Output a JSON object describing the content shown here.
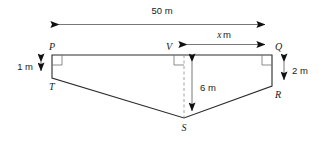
{
  "figure": {
    "background_color": "#ffffff",
    "line_color": "#2b2b2b",
    "dash_color": "#8a8a8a",
    "text_color": "#1a1a1a",
    "vertices": {
      "p": "P",
      "q": "Q",
      "r": "R",
      "s": "S",
      "t": "T",
      "v": "V"
    },
    "dimensions": {
      "top_width": "50 m",
      "right_segment": "x m",
      "right_segment_value": "x",
      "right_segment_unit": "m",
      "left_height": "1 m",
      "right_height": "2 m",
      "centre_depth": "6 m"
    }
  }
}
